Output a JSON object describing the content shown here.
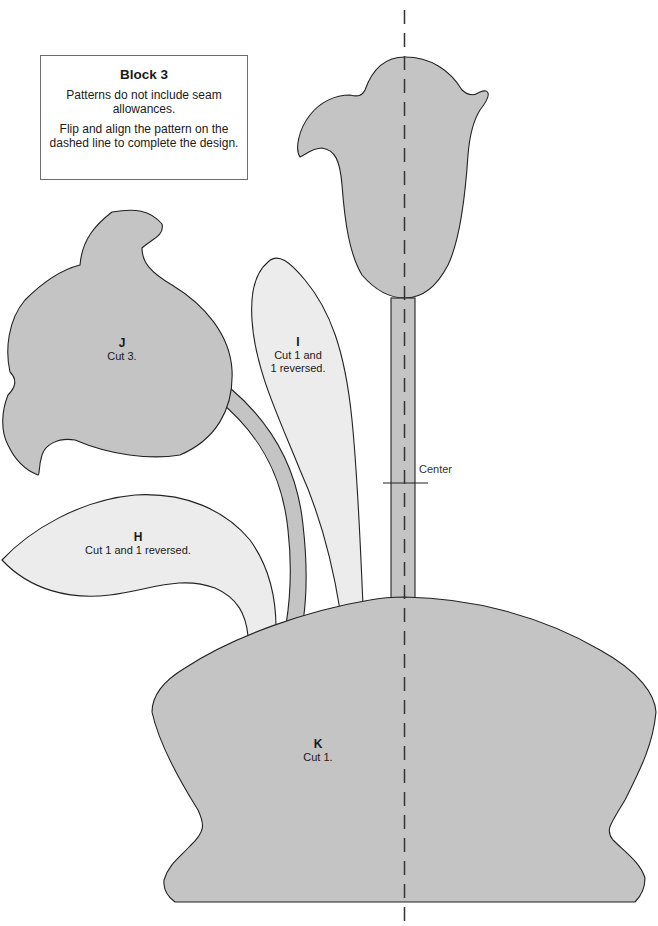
{
  "info_box": {
    "title": "Block 3",
    "note_1": "Patterns do not include seam allowances.",
    "note_2": "Flip and align the pattern on the dashed line to complete the design."
  },
  "pieces": {
    "H": {
      "letter": "H",
      "instruction": "Cut 1 and 1 reversed."
    },
    "I": {
      "letter": "I",
      "instruction_1": "Cut 1 and",
      "instruction_2": "1 reversed."
    },
    "J": {
      "letter": "J",
      "instruction": "Cut 3."
    },
    "K": {
      "letter": "K",
      "instruction": "Cut 1."
    }
  },
  "center_mark": {
    "label": "Center"
  },
  "colors": {
    "dark_fill": "#c4c4c4",
    "light_fill": "#ececec",
    "outline": "#222222",
    "dashed_line": "#333333"
  }
}
